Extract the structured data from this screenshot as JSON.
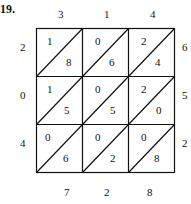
{
  "problem_number": "19.",
  "top_factor_digits": [
    "3",
    "1",
    "4"
  ],
  "right_factor_digits": [
    "6",
    "5",
    "2"
  ],
  "left_carry_digits": [
    "2",
    "0",
    "4"
  ],
  "bottom_result_digits": [
    "7",
    "2",
    "8"
  ],
  "grid": {
    "rows": [
      {
        "cells": [
          {
            "tens": "1",
            "ones": "8"
          },
          {
            "tens": "0",
            "ones": "6"
          },
          {
            "tens": "2",
            "ones": "4"
          }
        ]
      },
      {
        "cells": [
          {
            "tens": "1",
            "ones": "5"
          },
          {
            "tens": "0",
            "ones": "5"
          },
          {
            "tens": "2",
            "ones": "0"
          }
        ]
      },
      {
        "cells": [
          {
            "tens": "0",
            "ones": "6"
          },
          {
            "tens": "0",
            "ones": "2"
          },
          {
            "tens": "0",
            "ones": "8"
          }
        ]
      }
    ]
  },
  "colors": {
    "line": "#111111",
    "text": "#111111",
    "background": "#ffffff"
  }
}
